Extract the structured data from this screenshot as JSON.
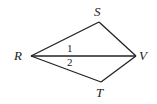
{
  "diagram": {
    "points": {
      "R": {
        "label": "R",
        "x": 31,
        "y": 56
      },
      "S": {
        "label": "S",
        "x": 99,
        "y": 22
      },
      "V": {
        "label": "V",
        "x": 136,
        "y": 56
      },
      "T": {
        "label": "T",
        "x": 101,
        "y": 82
      }
    },
    "segments": [
      [
        "R",
        "S"
      ],
      [
        "S",
        "V"
      ],
      [
        "R",
        "V"
      ],
      [
        "R",
        "T"
      ],
      [
        "T",
        "V"
      ]
    ],
    "angle_labels": {
      "angle1": "1",
      "angle2": "2"
    },
    "stroke_color": "#222222"
  }
}
